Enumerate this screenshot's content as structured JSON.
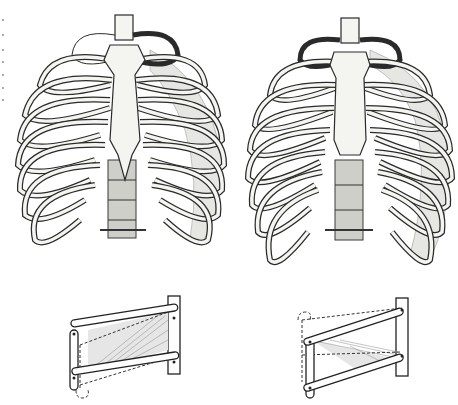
{
  "figure": {
    "panels": [
      {
        "id": "ribcage-expiration",
        "position": "top-left",
        "state": "expiration"
      },
      {
        "id": "ribcage-inspiration",
        "position": "top-right",
        "state": "inspiration"
      },
      {
        "id": "lever-model-left",
        "position": "bottom-left",
        "state": "bars raised, hatched muscle stretched"
      },
      {
        "id": "lever-model-right",
        "position": "bottom-right",
        "state": "bars lowered, hatched muscle shortened"
      }
    ],
    "colors": {
      "background": "#ffffff",
      "ink": "#2a2a2a",
      "bone_fill": "#f4f4f0",
      "muscle_shade": "#e6e6e2",
      "vertebra_stipple": "#cfcfc9"
    }
  }
}
